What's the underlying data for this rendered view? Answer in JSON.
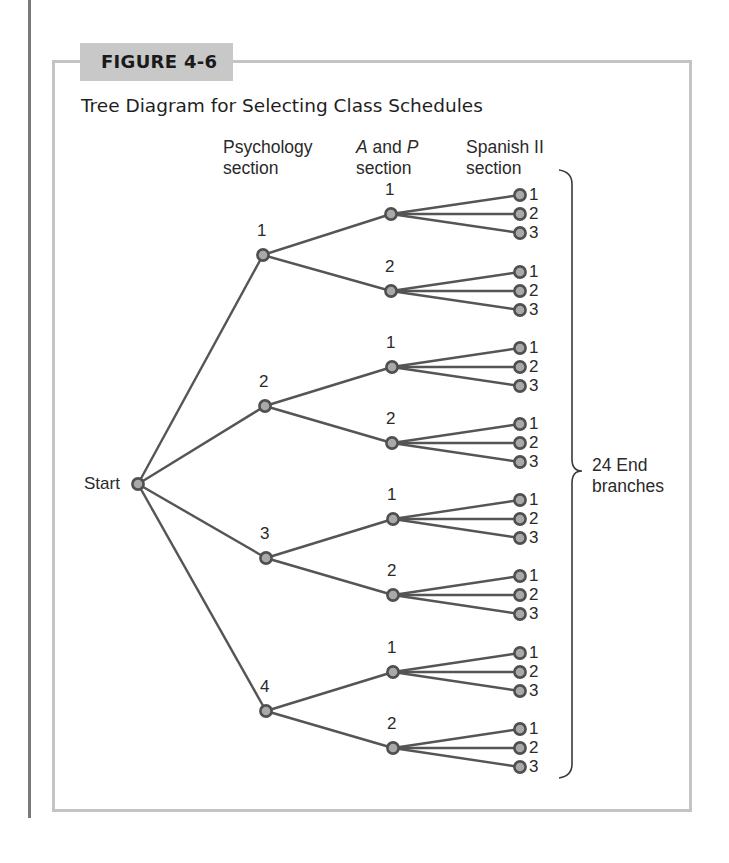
{
  "figure": {
    "label": "FIGURE 4-6",
    "title": "Tree Diagram for Selecting Class Schedules"
  },
  "headers": {
    "psychology": {
      "line1": "Psychology",
      "line2": "section"
    },
    "ap": {
      "italic_a": "A",
      "and": " and ",
      "italic_p": "P",
      "line2": "section"
    },
    "spanish": {
      "line1": "Spanish II",
      "line2": "section"
    }
  },
  "start_label": "Start",
  "end_label": {
    "line1": "24 End",
    "line2": "branches"
  },
  "colors": {
    "line": "#555555",
    "node_fill": "#a9a9a9",
    "node_stroke": "#4f4f4f",
    "frame": "#c4c4c4",
    "label_bg": "#c8c8c8"
  },
  "tree": {
    "start": {
      "x": 138,
      "y": 484
    },
    "psychology_sections": [
      {
        "label": "1",
        "x": 263,
        "y": 255,
        "ap_sections": [
          {
            "label": "1",
            "x": 391,
            "y": 214,
            "spanish": [
              "1",
              "2",
              "3"
            ]
          },
          {
            "label": "2",
            "x": 391,
            "y": 291,
            "spanish": [
              "1",
              "2",
              "3"
            ]
          }
        ]
      },
      {
        "label": "2",
        "x": 265,
        "y": 406,
        "ap_sections": [
          {
            "label": "1",
            "x": 392,
            "y": 367,
            "spanish": [
              "1",
              "2",
              "3"
            ]
          },
          {
            "label": "2",
            "x": 392,
            "y": 443,
            "spanish": [
              "1",
              "2",
              "3"
            ]
          }
        ]
      },
      {
        "label": "3",
        "x": 266,
        "y": 558,
        "ap_sections": [
          {
            "label": "1",
            "x": 393,
            "y": 519,
            "spanish": [
              "1",
              "2",
              "3"
            ]
          },
          {
            "label": "2",
            "x": 393,
            "y": 595,
            "spanish": [
              "1",
              "2",
              "3"
            ]
          }
        ]
      },
      {
        "label": "4",
        "x": 266,
        "y": 711,
        "ap_sections": [
          {
            "label": "1",
            "x": 393,
            "y": 672,
            "spanish": [
              "1",
              "2",
              "3"
            ]
          },
          {
            "label": "2",
            "x": 393,
            "y": 748,
            "spanish": [
              "1",
              "2",
              "3"
            ]
          }
        ]
      }
    ],
    "leaf_x": 520,
    "leaf_offsets": [
      -19,
      0,
      19
    ],
    "total_end_branches": 24
  }
}
